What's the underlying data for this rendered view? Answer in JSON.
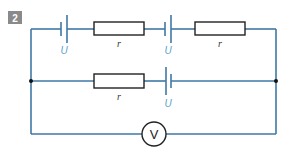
{
  "figure": {
    "number": "2",
    "colors": {
      "wire": "#3f78a4",
      "emf_label": "#5a9fd0",
      "number_box": "#8a8a8a"
    },
    "top_branch": {
      "battery_1": {
        "label": "U"
      },
      "resistor_1": {
        "label": "r"
      },
      "battery_2": {
        "label": "U"
      },
      "resistor_2": {
        "label": "r"
      }
    },
    "middle_branch": {
      "resistor": {
        "label": "r"
      },
      "battery": {
        "label": "U"
      }
    },
    "bottom_branch": {
      "voltmeter": {
        "symbol": "V"
      }
    }
  }
}
